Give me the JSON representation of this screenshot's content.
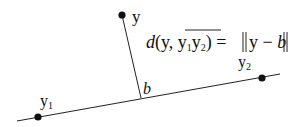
{
  "diagram": {
    "labels": {
      "point_y": "y",
      "point_y1": "y",
      "point_y1_sub": "1",
      "point_y2": "y",
      "point_y2_sub": "2",
      "foot_b": "b"
    },
    "formula": {
      "d": "d",
      "open": "(y, ",
      "seg1": "y",
      "seg1_sub": "1",
      "seg2": "y",
      "seg2_sub": "2",
      "close": ")",
      "equals": " = ",
      "norm_body": "y − ",
      "norm_b": "b"
    },
    "colors": {
      "stroke": "#111111",
      "background": "#ffffff"
    }
  }
}
